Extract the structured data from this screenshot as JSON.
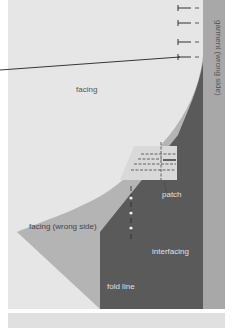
{
  "labels": {
    "facing": "facing",
    "garment": "garment (wrong side)",
    "patch": "patch",
    "facing_wrong_side": "facing (wrong side)",
    "interfacing": "interfacing",
    "fold_line": "fold line"
  },
  "colors": {
    "background": "#e6e6e6",
    "facing_wrong_side": "#b4b4b4",
    "interfacing": "#5a5a5a",
    "garment": "#a8a8a8",
    "patch": "#d9d9d9",
    "bottom_strip": "#e0e0e0",
    "label_dark": "#555555",
    "label_light": "#e8e8e8"
  }
}
